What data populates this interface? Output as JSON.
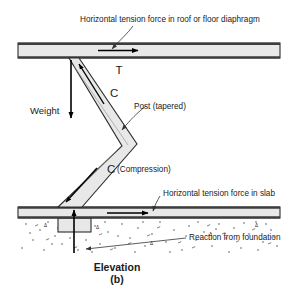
{
  "figure": {
    "caption_title": "Elevation",
    "caption_sub": "(b)"
  },
  "labels": {
    "top_callout": "Horizontal tension force in roof or floor diaphragm",
    "tension_top": "T",
    "weight": "Weight",
    "compression_upper": "C",
    "post_callout": "Post (tapered)",
    "compression_lower_symbol": "C",
    "compression_lower_text": "(Compression)",
    "slab_callout": "Horizontal tension force in slab",
    "reaction_callout": "Reaction from foundation"
  },
  "colors": {
    "member_fill": "#e8e8e8",
    "member_stroke": "#2b2b2b",
    "edge_dark": "#3d3d3d",
    "arrow": "#000000",
    "text": "#1a1a1a",
    "leader": "#333333",
    "soil": "#4a4a4a",
    "background": "#ffffff"
  },
  "elements": {
    "diaphragm_name": "roof-or-floor-diaphragm-beam",
    "post_name": "tapered-post-member",
    "slab_name": "ground-slab",
    "footing_name": "foundation-footing-block",
    "soil_name": "soil-hatch-region"
  }
}
